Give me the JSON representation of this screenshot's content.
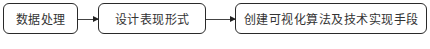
{
  "diagram": {
    "type": "flowchart",
    "direction": "left-to-right",
    "nodes": [
      {
        "id": "n1",
        "label": "数据处理"
      },
      {
        "id": "n2",
        "label": "设计表现形式"
      },
      {
        "id": "n3",
        "label": "创建可视化算法及技术实现手段"
      }
    ],
    "edges": [
      {
        "from": "n1",
        "to": "n2"
      },
      {
        "from": "n2",
        "to": "n3"
      }
    ]
  }
}
